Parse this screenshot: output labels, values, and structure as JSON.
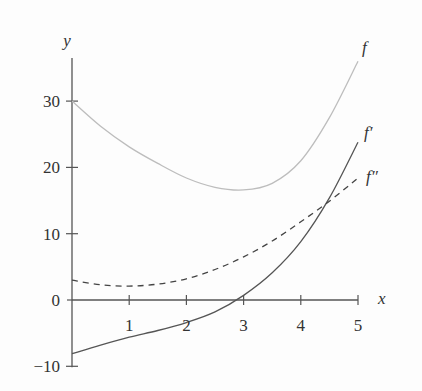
{
  "chart_data": {
    "type": "line",
    "title": "",
    "xlabel": "x",
    "ylabel": "y",
    "xlim": [
      0,
      5
    ],
    "ylim": [
      -10,
      38
    ],
    "x_ticks": [
      1,
      2,
      3,
      4,
      5
    ],
    "x_tick_labels": [
      "1",
      "2",
      "3",
      "4",
      "5"
    ],
    "y_ticks": [
      -10,
      0,
      10,
      20,
      30
    ],
    "y_tick_labels": [
      "−10",
      "0",
      "10",
      "20",
      "30"
    ],
    "grid": false,
    "legend": "inline labels at right end of curves",
    "series": [
      {
        "name": "f",
        "label": "f",
        "style": "solid",
        "color": "#bdbdbd",
        "x": [
          0,
          0.5,
          1,
          1.5,
          2,
          2.5,
          3,
          3.5,
          4,
          4.5,
          5
        ],
        "values": [
          30,
          26.2,
          23.1,
          20.6,
          18.4,
          17.0,
          16.6,
          17.6,
          21.0,
          27.5,
          36.0
        ]
      },
      {
        "name": "f'",
        "label": "f′",
        "style": "solid",
        "color": "#555555",
        "x": [
          0,
          0.5,
          1,
          1.5,
          2,
          2.5,
          3,
          3.5,
          4,
          4.5,
          5
        ],
        "values": [
          -8.1,
          -6.8,
          -5.6,
          -4.6,
          -3.4,
          -1.8,
          0.7,
          4.1,
          8.8,
          15.4,
          23.8
        ]
      },
      {
        "name": "f''",
        "label": "f″",
        "style": "dashed",
        "color": "#444444",
        "x": [
          0,
          0.5,
          1,
          1.5,
          2,
          2.5,
          3,
          3.5,
          4,
          4.5,
          5
        ],
        "values": [
          3.0,
          2.3,
          2.1,
          2.4,
          3.2,
          4.6,
          6.5,
          8.9,
          11.8,
          14.9,
          18.4
        ]
      }
    ]
  },
  "axes": {
    "x_label": "x",
    "y_label": "y"
  }
}
